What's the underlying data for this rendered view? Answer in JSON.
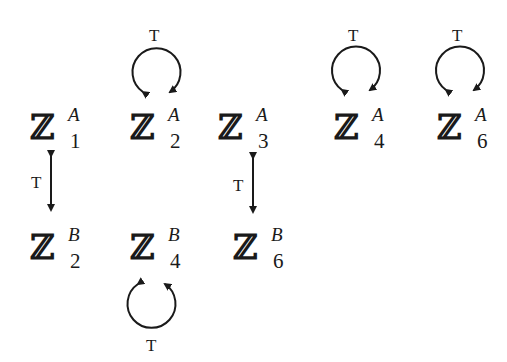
{
  "diagram": {
    "nodes": [
      {
        "id": "Z1A",
        "symbol": "ℤ",
        "sup": "A",
        "sub": "1"
      },
      {
        "id": "Z2A",
        "symbol": "ℤ",
        "sup": "A",
        "sub": "2"
      },
      {
        "id": "Z3A",
        "symbol": "ℤ",
        "sup": "A",
        "sub": "3"
      },
      {
        "id": "Z4A",
        "symbol": "ℤ",
        "sup": "A",
        "sub": "4"
      },
      {
        "id": "Z6A",
        "symbol": "ℤ",
        "sup": "A",
        "sub": "6"
      },
      {
        "id": "Z2B",
        "symbol": "ℤ",
        "sup": "B",
        "sub": "2"
      },
      {
        "id": "Z4B",
        "symbol": "ℤ",
        "sup": "B",
        "sub": "4"
      },
      {
        "id": "Z6B",
        "symbol": "ℤ",
        "sup": "B",
        "sub": "6"
      }
    ],
    "edges": [
      {
        "type": "self-loop",
        "node": "Z2A",
        "label": "T"
      },
      {
        "type": "self-loop",
        "node": "Z4A",
        "label": "T"
      },
      {
        "type": "self-loop",
        "node": "Z6A",
        "label": "T"
      },
      {
        "type": "self-loop",
        "node": "Z4B",
        "label": "T"
      },
      {
        "type": "double-arrow",
        "from": "Z1A",
        "to": "Z2B",
        "label": "T"
      },
      {
        "type": "double-arrow",
        "from": "Z3A",
        "to": "Z6B",
        "label": "T"
      }
    ]
  }
}
